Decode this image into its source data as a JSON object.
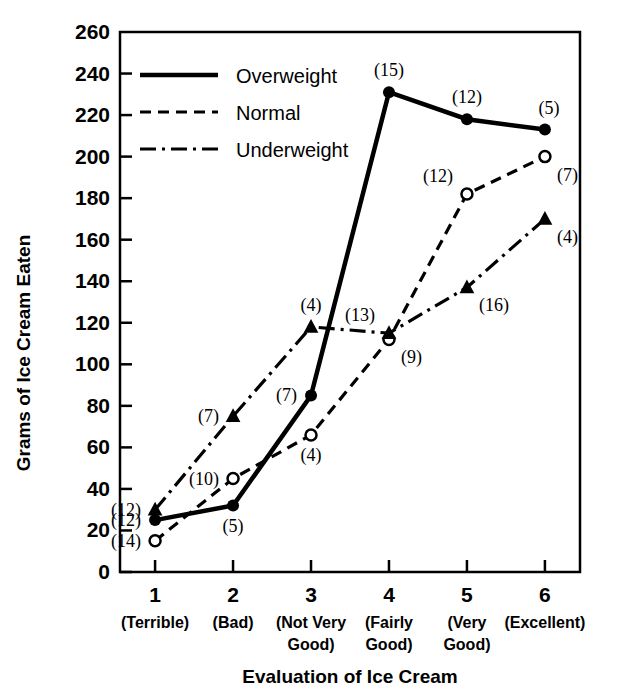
{
  "chart_data": {
    "type": "line",
    "title": "",
    "xlabel": "Evaluation of Ice Cream",
    "ylabel": "Grams of Ice Cream Eaten",
    "x": [
      1,
      2,
      3,
      4,
      5,
      6
    ],
    "categories": [
      "1",
      "2",
      "3",
      "4",
      "5",
      "6"
    ],
    "category_descriptions": [
      "(Terrible)",
      "(Bad)",
      "(Not Very Good)",
      "(Fairly Good)",
      "(Very Good)",
      "(Excellent)"
    ],
    "xlim": [
      0.55,
      6.45
    ],
    "ylim": [
      0,
      260
    ],
    "ytick_labels": [
      "0",
      "20",
      "40",
      "60",
      "80",
      "100",
      "120",
      "140",
      "160",
      "180",
      "200",
      "220",
      "240",
      "260"
    ],
    "yticks": [
      0,
      20,
      40,
      60,
      80,
      100,
      120,
      140,
      160,
      180,
      200,
      220,
      240,
      260
    ],
    "grid": false,
    "legend_position": "upper left inside",
    "series": [
      {
        "name": "Overweight",
        "style": "solid",
        "marker": "filled-circle",
        "values": [
          25,
          32,
          85,
          231,
          218,
          213
        ],
        "point_labels": [
          "(12)",
          "(5)",
          "(7)",
          "(15)",
          "(12)",
          "(5)"
        ],
        "label_positions": [
          "left",
          "below",
          "left",
          "above",
          "above",
          "above-right"
        ]
      },
      {
        "name": "Normal",
        "style": "dashed",
        "marker": "open-circle",
        "values": [
          15,
          45,
          66,
          112,
          182,
          200
        ],
        "point_labels": [
          "(14)",
          "(10)",
          "(4)",
          "(9)",
          "(12)",
          "(7)"
        ],
        "label_positions": [
          "left",
          "left",
          "below",
          "below-right",
          "above-left",
          "below-right"
        ]
      },
      {
        "name": "Underweight",
        "style": "dash-dot",
        "marker": "filled-triangle",
        "values": [
          30,
          75,
          118,
          115,
          137,
          170
        ],
        "point_labels": [
          "(12)",
          "(7)",
          "(4)",
          "(13)",
          "(16)",
          "(4)"
        ],
        "label_positions": [
          "left",
          "left",
          "above",
          "above-left",
          "below-right",
          "below-right"
        ]
      }
    ],
    "colors": {
      "line": "#000000",
      "background": "#ffffff",
      "text": "#000000"
    }
  },
  "legend": {
    "items": [
      {
        "label": "Overweight",
        "style": "solid"
      },
      {
        "label": "Normal",
        "style": "dashed"
      },
      {
        "label": "Underweight",
        "style": "dash-dot"
      }
    ]
  },
  "axes": {
    "y_title": "Grams of Ice Cream Eaten",
    "x_title": "Evaluation of Ice Cream"
  }
}
